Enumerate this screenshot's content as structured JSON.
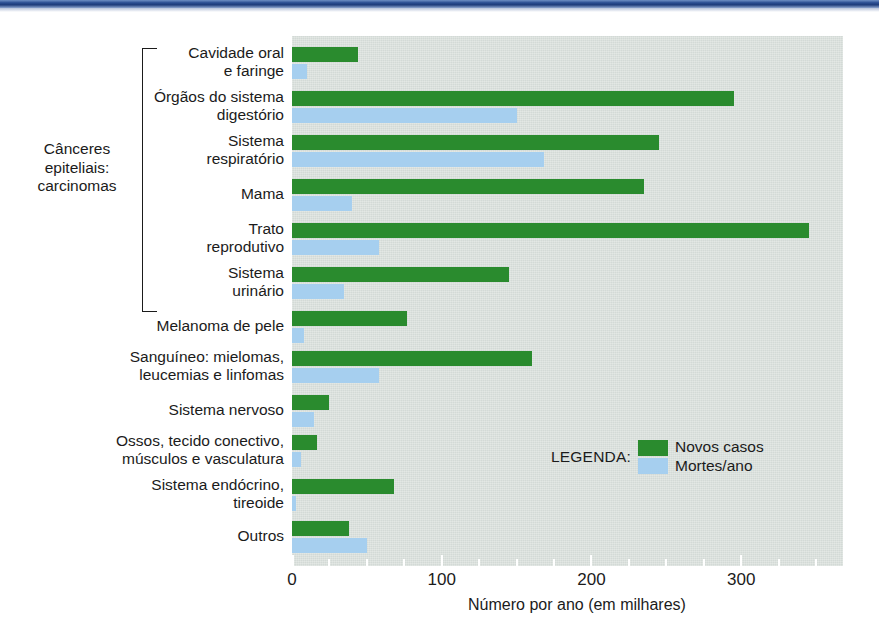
{
  "figure": {
    "x_axis_title": "Número por ano (em milhares)",
    "group_label": "Cânceres\nepiteliais:\ncarcinomas",
    "x_tick_labels": [
      "0",
      "100",
      "200",
      "300"
    ],
    "legend": {
      "title": "LEGENDA:",
      "series_new_label": "Novos casos",
      "series_deaths_label": "Mortes/ano"
    },
    "colors": {
      "new_cases": "#2a8b2e",
      "deaths": "#a6cfef",
      "plot_background": "#d3dad6",
      "top_band": "#2a4d91",
      "text": "#1b1b1b"
    }
  },
  "chart_data": {
    "type": "bar",
    "orientation": "horizontal",
    "title": "",
    "subtitle": "",
    "xlabel": "Número por ano (em milhares)",
    "ylabel": "",
    "xlim": [
      0,
      368
    ],
    "xticks": [
      0,
      100,
      200,
      300
    ],
    "minor_tick_step": 25,
    "grid": false,
    "legend_position": "inside-right",
    "group_bracket": {
      "label": "Cânceres epiteliais: carcinomas",
      "categories": [
        "Cavidade oral e faringe",
        "Órgãos do sistema digestório",
        "Sistema respiratório",
        "Mama",
        "Trato reprodutivo",
        "Sistema urinário"
      ]
    },
    "categories": [
      "Cavidade oral\ne faringe",
      "Órgãos do sistema\ndigestório",
      "Sistema\nrespiratório",
      "Mama",
      "Trato\nreprodutivo",
      "Sistema\nurinário",
      "Melanoma de pele",
      "Sanguíneo: mielomas,\nleucemias e linfomas",
      "Sistema nervoso",
      "Ossos, tecido conectivo,\nmúsculos e vasculatura",
      "Sistema endócrino,\ntireoide",
      "Outros"
    ],
    "series": [
      {
        "name": "Novos casos",
        "color": "#2a8b2e",
        "values": [
          44,
          295,
          245,
          235,
          345,
          145,
          77,
          160,
          25,
          17,
          68,
          38
        ]
      },
      {
        "name": "Mortes/ano",
        "color": "#a6cfef",
        "values": [
          10,
          150,
          168,
          40,
          58,
          35,
          8,
          58,
          15,
          6,
          3,
          50
        ]
      }
    ]
  }
}
